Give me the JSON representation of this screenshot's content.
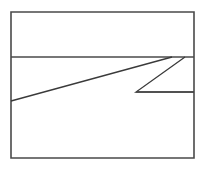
{
  "figure": {
    "canvas": {
      "width": 204,
      "height": 169,
      "background_color": "#ffffff"
    },
    "stroke": {
      "color": "#3a3a3a",
      "frame_color": "#4a4a4a",
      "width": 1.3,
      "frame_width": 1.6,
      "linecap": "butt",
      "linejoin": "miter"
    },
    "shapes": {
      "frame": {
        "name": "outer-rectangle",
        "x": 11,
        "y": 12,
        "width": 183,
        "height": 146,
        "points": "11,12 194,12 194,158 11,158 11,12"
      },
      "upper_divider": {
        "name": "upper-horizontal-line",
        "x1": 11,
        "y1": 57,
        "x2": 194,
        "y2": 57
      },
      "long_diagonal": {
        "name": "long-rising-diagonal",
        "x1": 11,
        "y1": 101,
        "x2": 172,
        "y2": 57
      },
      "zigzag": {
        "name": "zigzag-polyline",
        "points": "185,57 136,92 194,92"
      },
      "lower_segment": {
        "name": "lower-horizontal-segment",
        "x1": 136,
        "y1": 92,
        "x2": 194,
        "y2": 92
      }
    },
    "vertices": [
      {
        "name": "frame-top-left",
        "x": 11,
        "y": 12
      },
      {
        "name": "frame-top-right",
        "x": 194,
        "y": 12
      },
      {
        "name": "frame-bottom-right",
        "x": 194,
        "y": 158
      },
      {
        "name": "frame-bottom-left",
        "x": 11,
        "y": 158
      },
      {
        "name": "diagonal-left-endpoint",
        "x": 11,
        "y": 101
      },
      {
        "name": "diagonal-apex",
        "x": 172,
        "y": 57
      },
      {
        "name": "zigzag-top-right",
        "x": 185,
        "y": 57
      },
      {
        "name": "zigzag-bottom-vertex",
        "x": 136,
        "y": 92
      },
      {
        "name": "lower-segment-right-endpoint",
        "x": 194,
        "y": 92
      }
    ]
  }
}
